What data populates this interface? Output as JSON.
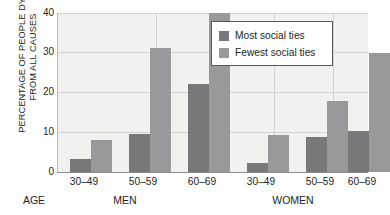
{
  "chart_data": {
    "type": "bar",
    "title": "",
    "subtitle": "",
    "xlabel": "AGE",
    "ylabel": "PERCENTAGE OF PEOPLE DYING FROM ALL CAUSES",
    "ylabel_lines": [
      "PERCENTAGE OF PEOPLE DYING",
      "FROM ALL CAUSES"
    ],
    "ylim": [
      0,
      40
    ],
    "yticks": [
      0,
      10,
      20,
      30,
      40
    ],
    "ytick_labels": [
      "0",
      "10",
      "20",
      "30",
      "40"
    ],
    "grid": true,
    "grid_axis": "y",
    "legend_position": "top-right",
    "categories": [
      "30–49",
      "50–59",
      "60–69",
      "30–49",
      "50–59",
      "60–69"
    ],
    "groups": [
      {
        "name": "MEN",
        "categories": [
          "30–49",
          "50–59",
          "60–69"
        ]
      },
      {
        "name": "WOMEN",
        "categories": [
          "30–49",
          "50–59",
          "60–69"
        ]
      }
    ],
    "series": [
      {
        "name": "Most social ties",
        "color": "#77787a",
        "values": [
          3.3,
          9.6,
          22.2,
          2.3,
          8.7,
          10.2
        ]
      },
      {
        "name": "Fewest social ties",
        "color": "#98999b",
        "values": [
          8.0,
          31.2,
          40.0,
          9.3,
          17.8,
          30.0
        ]
      }
    ]
  },
  "legend": {
    "items": [
      {
        "label": "Most social ties",
        "color": "#77787a"
      },
      {
        "label": "Fewest social ties",
        "color": "#98999b"
      }
    ]
  },
  "axis": {
    "y_title_line1": "PERCENTAGE OF PEOPLE DYING",
    "y_title_line2": "FROM ALL CAUSES",
    "age_label": "AGE",
    "ticks": [
      "0",
      "10",
      "20",
      "30",
      "40"
    ],
    "category_labels": [
      "30–49",
      "50–59",
      "60–69",
      "30–49",
      "50–59",
      "60–69"
    ],
    "group_labels": [
      "MEN",
      "WOMEN"
    ]
  },
  "colors": {
    "plot_background": "#f1f1ef",
    "gridline": "#d2d2d0",
    "axis_line": "#8e8e8e",
    "series_most": "#77787a",
    "series_fewest": "#98999b",
    "text": "#231f20",
    "legend_border": "#58585a"
  }
}
